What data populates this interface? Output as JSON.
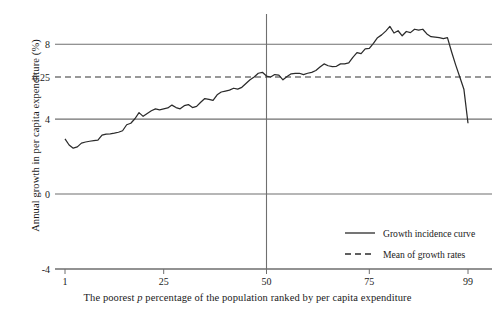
{
  "chart_data": {
    "type": "line",
    "title": "",
    "xlabel": "The poorest p percentage of the population ranked by per capita expenditure",
    "xlabel_parts": {
      "before": "The poorest ",
      "italic": "p",
      "after": " percentage of the population ranked by per capita expenditure"
    },
    "ylabel": "Annual growth in per capita expenditure (%)",
    "xlim": [
      1,
      99
    ],
    "ylim": [
      -4,
      9.4
    ],
    "xticks": [
      1,
      25,
      50,
      75,
      99
    ],
    "xtick_labels": [
      "1",
      "25",
      "50",
      "75",
      "99"
    ],
    "yticks": [
      8,
      6.25,
      4,
      0,
      -4
    ],
    "ytick_labels": [
      "8",
      "6.25",
      "4",
      "0",
      "-4"
    ],
    "gridlines": {
      "horizontal": [
        8,
        4,
        0,
        -4
      ],
      "vertical": [
        50
      ],
      "grid": true
    },
    "mean_of_growth_rates": 6.25,
    "axis_color": "#6f6f6f",
    "curve_color": "#2b2b2b",
    "legend": {
      "position": "lower-right",
      "entries": [
        {
          "label": "Growth incidence curve",
          "style": "solid"
        },
        {
          "label": "Mean of growth rates",
          "style": "dashed"
        }
      ]
    },
    "series": [
      {
        "name": "Growth incidence curve",
        "style": "solid",
        "x": [
          1,
          2,
          3,
          4,
          5,
          6,
          7,
          8,
          9,
          10,
          11,
          12,
          13,
          14,
          15,
          16,
          17,
          18,
          19,
          20,
          21,
          22,
          23,
          24,
          25,
          26,
          27,
          28,
          29,
          30,
          31,
          32,
          33,
          34,
          35,
          36,
          37,
          38,
          39,
          40,
          41,
          42,
          43,
          44,
          45,
          46,
          47,
          48,
          49,
          50,
          51,
          52,
          53,
          54,
          55,
          56,
          57,
          58,
          59,
          60,
          61,
          62,
          63,
          64,
          65,
          66,
          67,
          68,
          69,
          70,
          71,
          72,
          73,
          74,
          75,
          76,
          77,
          78,
          79,
          80,
          81,
          82,
          83,
          84,
          85,
          86,
          87,
          88,
          89,
          90,
          91,
          92,
          93,
          94,
          95,
          96,
          97,
          98,
          99
        ],
        "y": [
          2.95,
          2.62,
          2.45,
          2.52,
          2.72,
          2.78,
          2.82,
          2.85,
          2.88,
          3.15,
          3.2,
          3.22,
          3.25,
          3.3,
          3.38,
          3.7,
          3.78,
          4.02,
          4.35,
          4.15,
          4.3,
          4.45,
          4.55,
          4.5,
          4.55,
          4.6,
          4.75,
          4.62,
          4.55,
          4.72,
          4.78,
          4.62,
          4.68,
          4.9,
          5.1,
          5.05,
          5.0,
          5.3,
          5.45,
          5.5,
          5.55,
          5.65,
          5.6,
          5.7,
          5.9,
          6.1,
          6.25,
          6.45,
          6.5,
          6.3,
          6.25,
          6.38,
          6.35,
          6.1,
          6.28,
          6.42,
          6.45,
          6.45,
          6.38,
          6.45,
          6.5,
          6.6,
          6.78,
          6.95,
          6.85,
          6.8,
          6.82,
          6.95,
          6.95,
          7.0,
          7.3,
          7.55,
          7.5,
          7.75,
          7.78,
          8.05,
          8.35,
          8.5,
          8.7,
          8.95,
          8.6,
          8.72,
          8.45,
          8.68,
          8.62,
          8.8,
          8.75,
          8.8,
          8.55,
          8.4,
          8.38,
          8.35,
          8.3,
          8.35,
          7.6,
          6.9,
          6.25,
          5.6,
          3.78
        ]
      },
      {
        "name": "Mean of growth rates",
        "style": "dashed",
        "constant_y": 6.25
      }
    ]
  }
}
